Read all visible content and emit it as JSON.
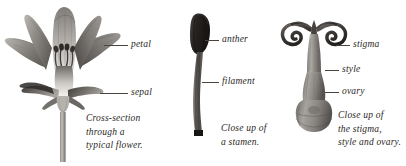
{
  "plate": {
    "title": "Flower anatomy illustration plate",
    "background_color": "#ffffff",
    "ink_color": "#2b2724",
    "leader_color": "#4a443f"
  },
  "figures": [
    {
      "id": "flower-cross-section",
      "name": "Cross-section through a typical flower",
      "caption_lines": [
        "Cross-section",
        "through a",
        "typical flower."
      ],
      "labels": [
        {
          "id": "petal",
          "text": "petal"
        },
        {
          "id": "sepal",
          "text": "sepal"
        }
      ]
    },
    {
      "id": "stamen",
      "name": "Close up of a stamen",
      "caption_lines": [
        "Close up of",
        "a stamen."
      ],
      "labels": [
        {
          "id": "anther",
          "text": "anther"
        },
        {
          "id": "filament",
          "text": "filament"
        }
      ]
    },
    {
      "id": "pistil",
      "name": "Close up of the stigma, style and ovary",
      "caption_lines": [
        "Close up of",
        "the stigma,",
        "style and ovary."
      ],
      "labels": [
        {
          "id": "stigma",
          "text": "stigma"
        },
        {
          "id": "style",
          "text": "style"
        },
        {
          "id": "ovary",
          "text": "ovary"
        }
      ]
    }
  ]
}
